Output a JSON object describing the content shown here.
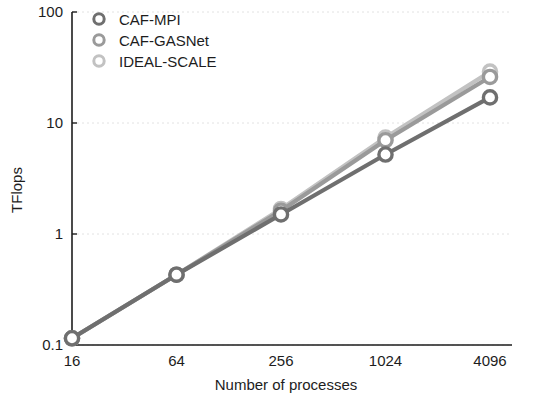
{
  "chart_data": {
    "type": "line",
    "title": "",
    "xlabel": "Number of processes",
    "ylabel": "TFlops",
    "xscale": "log",
    "yscale": "log",
    "x": [
      16,
      64,
      256,
      1024,
      4096
    ],
    "xtick_labels": [
      "16",
      "64",
      "256",
      "1024",
      "4096"
    ],
    "ytick_labels": [
      "0.1",
      "1",
      "10",
      "100"
    ],
    "ytick_values": [
      0.1,
      1,
      10,
      100
    ],
    "ylim": [
      0.1,
      100
    ],
    "xlim": [
      16,
      4096
    ],
    "grid": true,
    "grid_axis": "y",
    "legend_position": "top-left-inside",
    "series": [
      {
        "name": "CAF-MPI",
        "values": [
          0.115,
          0.43,
          1.5,
          5.2,
          17.0
        ],
        "color": "#6f6f6f",
        "marker": "circle-open"
      },
      {
        "name": "CAF-GASNet",
        "values": [
          0.115,
          0.43,
          1.62,
          7.0,
          26.0
        ],
        "color": "#9a9a9a",
        "marker": "circle-open"
      },
      {
        "name": "IDEAL-SCALE",
        "values": [
          0.115,
          0.43,
          1.68,
          7.4,
          29.0
        ],
        "color": "#c2c2c2",
        "marker": "circle-open"
      }
    ]
  },
  "axes": {
    "y_title": "TFlops",
    "x_title": "Number of processes",
    "x_ticks": [
      "16",
      "64",
      "256",
      "1024",
      "4096"
    ],
    "y_ticks": [
      "100",
      "10",
      "1",
      "0.1"
    ]
  },
  "legend": {
    "entries": [
      {
        "label": "CAF-MPI",
        "color": "#6f6f6f"
      },
      {
        "label": "CAF-GASNet",
        "color": "#9a9a9a"
      },
      {
        "label": "IDEAL-SCALE",
        "color": "#c2c2c2"
      }
    ]
  },
  "colors": {
    "axis": "#1d1d1d",
    "grid": "#e2e2e2",
    "background": "#ffffff"
  }
}
